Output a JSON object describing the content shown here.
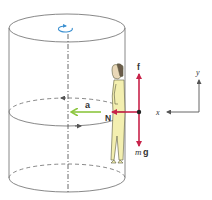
{
  "figure": {
    "colors": {
      "outline": "#7a7a7a",
      "force_arrow": "#c8234a",
      "acceleration_arrow": "#8cc63f",
      "rotation_icon": "#3a8fd0",
      "person_fill": "#f3efb0",
      "axes": "#555555",
      "label": "#333333"
    },
    "labels": {
      "friction": "f",
      "normal": "N",
      "acceleration": "a",
      "weight_m": "m",
      "weight_g": "g",
      "axis_x": "x",
      "axis_y": "y"
    },
    "icons": {
      "rotation": "rotation-arrow-icon",
      "person": "person-figure"
    }
  }
}
